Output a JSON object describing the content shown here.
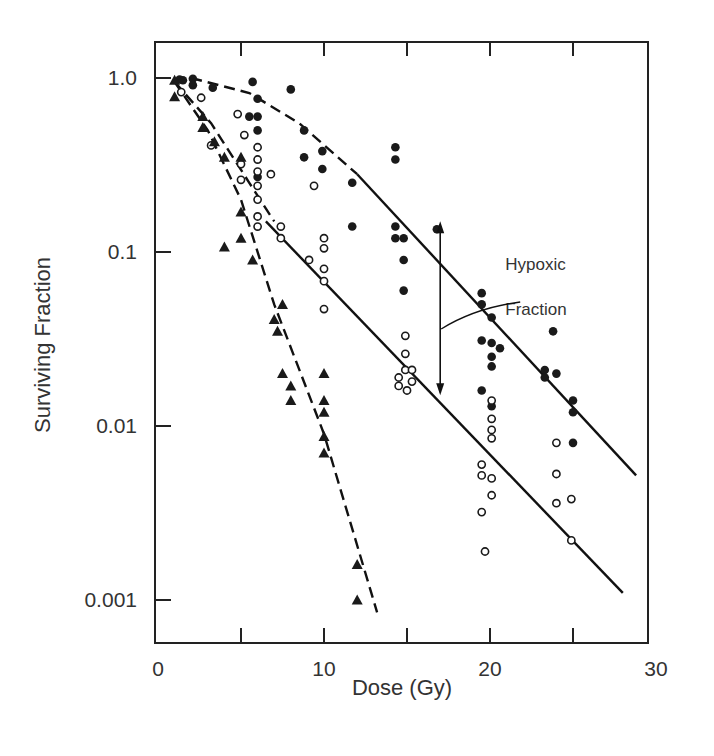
{
  "chart_data": {
    "type": "scatter",
    "title": "",
    "xlabel": "Dose (Gy)",
    "ylabel": "Surviving Fraction",
    "xlim": [
      0,
      30
    ],
    "ylim": [
      0.0006,
      2.0
    ],
    "yscale": "log",
    "grid": false,
    "legend": null,
    "x_ticks": [
      0,
      5,
      10,
      15,
      20,
      25,
      30
    ],
    "x_tick_labels": [
      "0",
      "",
      "10",
      "",
      "20",
      "",
      "30"
    ],
    "y_ticks": [
      1.0,
      0.1,
      0.01,
      0.001
    ],
    "y_tick_labels": [
      "1.0",
      "0.1",
      "0.01",
      "0.001"
    ],
    "annotations": [
      {
        "text": "Hypoxic",
        "x": 20.8,
        "y": 0.085
      },
      {
        "text": "Fraction",
        "x": 20.8,
        "y": 0.047
      },
      {
        "type": "double-arrow",
        "x": 17,
        "y_from": 0.15,
        "y_to": 0.015,
        "label": "Hypoxic Fraction"
      }
    ],
    "series": [
      {
        "name": "filled circles",
        "marker": "circle-filled",
        "points": [
          [
            1.3,
            0.98
          ],
          [
            1.5,
            0.97
          ],
          [
            2.1,
            0.99
          ],
          [
            2.1,
            0.91
          ],
          [
            3.3,
            0.88
          ],
          [
            5.7,
            0.95
          ],
          [
            6.0,
            0.76
          ],
          [
            8.0,
            0.86
          ],
          [
            5.5,
            0.6
          ],
          [
            6.0,
            0.6
          ],
          [
            6.0,
            0.5
          ],
          [
            6.0,
            0.27
          ],
          [
            8.8,
            0.5
          ],
          [
            8.8,
            0.35
          ],
          [
            9.9,
            0.38
          ],
          [
            9.9,
            0.3
          ],
          [
            11.7,
            0.25
          ],
          [
            11.7,
            0.14
          ],
          [
            14.3,
            0.4
          ],
          [
            14.3,
            0.34
          ],
          [
            14.3,
            0.14
          ],
          [
            14.3,
            0.12
          ],
          [
            14.8,
            0.12
          ],
          [
            16.8,
            0.135
          ],
          [
            14.8,
            0.09
          ],
          [
            14.8,
            0.06
          ],
          [
            19.5,
            0.058
          ],
          [
            19.5,
            0.05
          ],
          [
            20.1,
            0.042
          ],
          [
            19.5,
            0.031
          ],
          [
            20.1,
            0.03
          ],
          [
            20.6,
            0.028
          ],
          [
            20.1,
            0.025
          ],
          [
            20.1,
            0.022
          ],
          [
            19.5,
            0.016
          ],
          [
            20.1,
            0.013
          ],
          [
            23.3,
            0.021
          ],
          [
            23.3,
            0.019
          ],
          [
            24.0,
            0.02
          ],
          [
            23.8,
            0.035
          ],
          [
            25.0,
            0.014
          ],
          [
            25.0,
            0.012
          ],
          [
            25.0,
            0.008
          ]
        ]
      },
      {
        "name": "open circles",
        "marker": "circle-open",
        "points": [
          [
            1.4,
            0.83
          ],
          [
            2.6,
            0.77
          ],
          [
            3.2,
            0.41
          ],
          [
            4.8,
            0.62
          ],
          [
            5.2,
            0.47
          ],
          [
            5.0,
            0.32
          ],
          [
            5.0,
            0.26
          ],
          [
            6.0,
            0.4
          ],
          [
            6.0,
            0.34
          ],
          [
            6.0,
            0.29
          ],
          [
            6.0,
            0.24
          ],
          [
            6.0,
            0.2
          ],
          [
            6.0,
            0.16
          ],
          [
            6.0,
            0.14
          ],
          [
            6.8,
            0.28
          ],
          [
            7.4,
            0.14
          ],
          [
            7.4,
            0.12
          ],
          [
            9.4,
            0.24
          ],
          [
            9.1,
            0.09
          ],
          [
            10.0,
            0.12
          ],
          [
            10.0,
            0.105
          ],
          [
            10.0,
            0.08
          ],
          [
            10.0,
            0.068
          ],
          [
            10.0,
            0.047
          ],
          [
            14.9,
            0.033
          ],
          [
            14.9,
            0.026
          ],
          [
            14.9,
            0.021
          ],
          [
            14.5,
            0.019
          ],
          [
            14.5,
            0.017
          ],
          [
            15.0,
            0.016
          ],
          [
            15.3,
            0.018
          ],
          [
            15.3,
            0.021
          ],
          [
            19.5,
            0.006
          ],
          [
            19.5,
            0.0052
          ],
          [
            20.1,
            0.014
          ],
          [
            20.1,
            0.011
          ],
          [
            20.1,
            0.0095
          ],
          [
            20.1,
            0.0085
          ],
          [
            20.1,
            0.005
          ],
          [
            20.1,
            0.004
          ],
          [
            19.5,
            0.0032
          ],
          [
            19.7,
            0.0019
          ],
          [
            24.0,
            0.008
          ],
          [
            24.0,
            0.0053
          ],
          [
            24.0,
            0.0036
          ],
          [
            24.9,
            0.0038
          ],
          [
            24.9,
            0.0022
          ]
        ]
      },
      {
        "name": "filled triangles",
        "marker": "triangle-filled",
        "points": [
          [
            1.0,
            0.97
          ],
          [
            1.0,
            0.78
          ],
          [
            2.7,
            0.6
          ],
          [
            2.7,
            0.52
          ],
          [
            3.4,
            0.43
          ],
          [
            4.0,
            0.35
          ],
          [
            4.0,
            0.107
          ],
          [
            5.0,
            0.35
          ],
          [
            5.0,
            0.17
          ],
          [
            5.0,
            0.12
          ],
          [
            5.7,
            0.09
          ],
          [
            7.0,
            0.041
          ],
          [
            7.2,
            0.035
          ],
          [
            7.5,
            0.05
          ],
          [
            7.5,
            0.02
          ],
          [
            8.0,
            0.017
          ],
          [
            8.0,
            0.014
          ],
          [
            10.0,
            0.02
          ],
          [
            10.0,
            0.014
          ],
          [
            10.0,
            0.012
          ],
          [
            10.0,
            0.0087
          ],
          [
            10.0,
            0.007
          ],
          [
            12.0,
            0.0016
          ],
          [
            12.0,
            0.001
          ]
        ]
      }
    ],
    "curves": [
      {
        "name": "aerated fit (dashed)",
        "style": "dashed",
        "points": [
          [
            2.0,
            1.0
          ],
          [
            5.5,
            0.82
          ],
          [
            8.5,
            0.55
          ],
          [
            12.0,
            0.28
          ]
        ]
      },
      {
        "name": "aerated fit (solid)",
        "style": "solid",
        "points": [
          [
            12.0,
            0.28
          ],
          [
            28.8,
            0.0052
          ]
        ]
      },
      {
        "name": "hypoxic fit (dashed)",
        "style": "dashed",
        "points": [
          [
            1.0,
            0.95
          ],
          [
            3.2,
            0.55
          ],
          [
            5.5,
            0.25
          ],
          [
            7.0,
            0.15
          ]
        ]
      },
      {
        "name": "hypoxic fit (solid)",
        "style": "solid",
        "points": [
          [
            6.5,
            0.15
          ],
          [
            28.0,
            0.0011
          ]
        ]
      },
      {
        "name": "triangle fit (dashed)",
        "style": "dashed",
        "points": [
          [
            1.0,
            0.95
          ],
          [
            3.0,
            0.5
          ],
          [
            5.0,
            0.2
          ],
          [
            7.0,
            0.05
          ],
          [
            10.0,
            0.009
          ],
          [
            13.2,
            0.00085
          ]
        ]
      }
    ]
  }
}
